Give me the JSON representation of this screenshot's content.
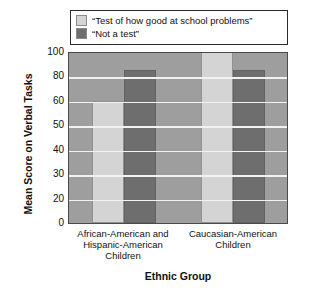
{
  "chart_data": {
    "type": "bar",
    "title": "",
    "xlabel": "Ethnic Group",
    "ylabel": "Mean Score on Verbal Tasks",
    "categories": [
      "African-American and Hispanic-American Children",
      "Caucasian-American Children"
    ],
    "series": [
      {
        "name": "“Test of how good at school problems”",
        "color": "#d4d4d4",
        "values": [
          60,
          100
        ]
      },
      {
        "name": "“Not a test”",
        "color": "#6e6e6e",
        "values": [
          85,
          85
        ]
      }
    ],
    "ytick_labels": [
      "100",
      "80",
      "60",
      "50",
      "40",
      "30",
      "20",
      "0"
    ],
    "ytick_values": [
      100,
      80,
      60,
      50,
      40,
      30,
      20,
      0
    ],
    "ylim": [
      0,
      100
    ],
    "grid": true,
    "legend_position": "top",
    "plot_background": "#9e9e9e",
    "gridline_color": "#f2f2f2"
  },
  "legend": {
    "items": [
      {
        "label": "“Test of how good at school problems”"
      },
      {
        "label": "“Not a test”"
      }
    ]
  },
  "axes": {
    "y_title": "Mean Score on Verbal Tasks",
    "x_title": "Ethnic Group",
    "x_categories": [
      {
        "lines": [
          "African-American and",
          "Hispanic-American",
          "Children"
        ]
      },
      {
        "lines": [
          "Caucasian-American",
          "Children"
        ]
      }
    ]
  }
}
